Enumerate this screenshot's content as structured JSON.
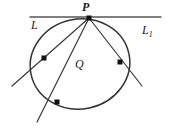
{
  "figure": {
    "labels": {
      "point_p": "P",
      "line_left": "L",
      "line_right_base": "L",
      "line_right_sub": "1",
      "region_q": "Q"
    },
    "colors": {
      "stroke": "#333333",
      "tangent_stroke": "#555555",
      "point_fill": "#111111",
      "background": "#ffffff"
    },
    "geometry": {
      "tangent_line": {
        "x1": 30,
        "y1": 17,
        "x2": 161,
        "y2": 17
      },
      "ellipse": {
        "cx": 80,
        "cy": 64,
        "rx": 50,
        "ry": 45,
        "rotation": -12
      },
      "tangent_point": {
        "x": 89,
        "y": 18,
        "name": "P"
      },
      "secants": [
        {
          "name": "secant-left",
          "from": [
            89,
            18
          ],
          "to": [
            12,
            86
          ],
          "mark": [
            44,
            58
          ]
        },
        {
          "name": "secant-bottom",
          "from": [
            89,
            18
          ],
          "to": [
            37,
            122
          ],
          "mark": [
            57,
            102
          ]
        },
        {
          "name": "secant-right",
          "from": [
            89,
            18
          ],
          "to": [
            142,
            86
          ],
          "mark": [
            120,
            62
          ]
        }
      ],
      "marked_points": [
        {
          "x": 44,
          "y": 58,
          "name": "intersection-left"
        },
        {
          "x": 57,
          "y": 102,
          "name": "intersection-bottom"
        },
        {
          "x": 120,
          "y": 62,
          "name": "intersection-right"
        },
        {
          "x": 89,
          "y": 18,
          "name": "tangency-point"
        }
      ]
    }
  }
}
